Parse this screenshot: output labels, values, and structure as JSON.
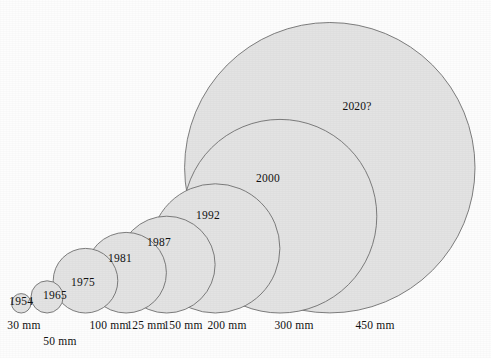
{
  "figure": {
    "background_color": "#fdfdfd",
    "circle_fill": "#e3e3e3",
    "circle_stroke": "#6f6f6f",
    "baseline_y": 313,
    "pixels_per_mm": 0.6455
  },
  "chart_data": {
    "type": "bubble",
    "title": "",
    "subtitle": "",
    "xlabel": "",
    "ylabel": "",
    "legend": [],
    "categories": [
      "1954",
      "1965",
      "1975",
      "1981",
      "1987",
      "1992",
      "2000",
      "2020?"
    ],
    "values": [
      30,
      50,
      100,
      125,
      150,
      200,
      300,
      450
    ],
    "unit": "mm",
    "tick_labels": [
      "30 mm",
      "50 mm",
      "100 mm",
      "125 mm",
      "150 mm",
      "200 mm",
      "300 mm",
      "450 mm"
    ],
    "series": [
      {
        "name": "Wafer diameter",
        "points": [
          {
            "year": "1954",
            "diameter_mm": 30,
            "size_label": "30 mm",
            "cx": 21.2,
            "cy": 303.3,
            "r": 9.7,
            "year_label_x": 21.2,
            "year_label_y": 304.5,
            "size_label_x": 24,
            "size_label_y": 329
          },
          {
            "year": "1965",
            "diameter_mm": 50,
            "size_label": "50 mm",
            "cx": 47.1,
            "cy": 296.9,
            "r": 16.1,
            "year_label_x": 55,
            "year_label_y": 298.5,
            "size_label_x": 60,
            "size_label_y": 345
          },
          {
            "year": "1975",
            "diameter_mm": 100,
            "size_label": "100 mm",
            "cx": 85.5,
            "cy": 280.7,
            "r": 32.3,
            "year_label_x": 83,
            "year_label_y": 285.5,
            "size_label_x": 109,
            "size_label_y": 329
          },
          {
            "year": "1981",
            "diameter_mm": 125,
            "size_label": "125 mm",
            "cx": 126.1,
            "cy": 272.7,
            "r": 40.3,
            "year_label_x": 120,
            "year_label_y": 262,
            "size_label_x": 146,
            "size_label_y": 329
          },
          {
            "year": "1987",
            "diameter_mm": 150,
            "size_label": "150 mm",
            "cx": 166.7,
            "cy": 264.6,
            "r": 48.4,
            "year_label_x": 159,
            "year_label_y": 245.5,
            "size_label_x": 183,
            "size_label_y": 329
          },
          {
            "year": "1992",
            "diameter_mm": 200,
            "size_label": "200 mm",
            "cx": 215.3,
            "cy": 248.4,
            "r": 64.6,
            "year_label_x": 208,
            "year_label_y": 219,
            "size_label_x": 227,
            "size_label_y": 329
          },
          {
            "year": "2000",
            "diameter_mm": 300,
            "size_label": "300 mm",
            "cx": 280.0,
            "cy": 216.2,
            "r": 96.8,
            "year_label_x": 268,
            "year_label_y": 182,
            "size_label_x": 294,
            "size_label_y": 329
          },
          {
            "year": "2020?",
            "diameter_mm": 450,
            "size_label": "450 mm",
            "cx": 329.8,
            "cy": 167.7,
            "r": 145.2,
            "year_label_x": 357,
            "year_label_y": 110,
            "size_label_x": 375,
            "size_label_y": 329
          }
        ]
      }
    ],
    "axis": {
      "baseline_y": 313,
      "grid": false
    }
  }
}
